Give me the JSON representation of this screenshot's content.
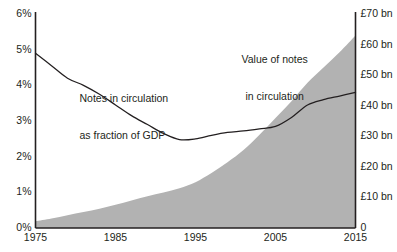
{
  "chart_data": {
    "type": "area",
    "title": "",
    "subtitle": "",
    "xlabel": "",
    "ylabel": "",
    "grid": false,
    "legend_position": "inline-annotations",
    "x_axis": {
      "ticks": [
        "1975",
        "1985",
        "1995",
        "2005",
        "2015"
      ],
      "values": [
        1975,
        1985,
        1995,
        2005,
        2015
      ],
      "xlim": [
        1975,
        2015
      ]
    },
    "y_axis_left": {
      "label": "Notes in circulation as fraction of GDP",
      "ticks": [
        "0%",
        "1%",
        "2%",
        "3%",
        "4%",
        "5%",
        "6%"
      ],
      "values": [
        0,
        1,
        2,
        3,
        4,
        5,
        6
      ],
      "ylim": [
        0,
        6
      ],
      "unit": "%"
    },
    "y_axis_right": {
      "label": "Value of notes in circulation",
      "ticks": [
        "0",
        "£10 bn",
        "£20 bn",
        "£30 bn",
        "£40 bn",
        "£50 bn",
        "£60 bn",
        "£70 bn"
      ],
      "values": [
        0,
        10,
        20,
        30,
        40,
        50,
        60,
        70
      ],
      "ylim": [
        0,
        70
      ],
      "unit": "£ bn"
    },
    "series": [
      {
        "name": "Value of notes in circulation",
        "render": "area",
        "axis": "right",
        "color": "#b2b2b2",
        "x": [
          1975,
          1977,
          1979,
          1981,
          1983,
          1985,
          1987,
          1989,
          1991,
          1993,
          1995,
          1997,
          1999,
          2001,
          2003,
          2005,
          2007,
          2009,
          2011,
          2013,
          2015
        ],
        "values": [
          2.2,
          3.1,
          4.2,
          5.2,
          6.3,
          7.6,
          9.0,
          10.4,
          11.6,
          13.0,
          15.0,
          18.0,
          21.5,
          25.5,
          30.5,
          36.0,
          41.5,
          47.5,
          52.5,
          57.5,
          63.0
        ]
      },
      {
        "name": "Notes in circulation as fraction of GDP",
        "render": "line",
        "axis": "left",
        "color": "#231f20",
        "x": [
          1975,
          1977,
          1979,
          1981,
          1983,
          1985,
          1987,
          1989,
          1991,
          1993,
          1995,
          1997,
          1999,
          2001,
          2003,
          2005,
          2007,
          2009,
          2011,
          2013,
          2015
        ],
        "values": [
          4.9,
          4.55,
          4.2,
          4.0,
          3.75,
          3.45,
          3.15,
          2.9,
          2.65,
          2.48,
          2.5,
          2.6,
          2.68,
          2.72,
          2.78,
          2.85,
          3.1,
          3.45,
          3.6,
          3.7,
          3.8
        ]
      }
    ],
    "annotations": [
      {
        "text_line1": "Notes in circulation",
        "text_line2": "as fraction of GDP",
        "x": 1980.5,
        "y_pct": 4.35
      },
      {
        "text_line1": "Value of notes",
        "text_line2": "in circulation",
        "x": 2006.5,
        "y_pct": 5.45
      }
    ]
  },
  "colors": {
    "area_fill": "#b2b2b2",
    "line_stroke": "#231f20",
    "axis_stroke": "#231f20",
    "background": "#ffffff",
    "text": "#231f20"
  }
}
